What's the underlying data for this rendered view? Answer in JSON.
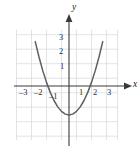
{
  "chart_data": {
    "type": "line",
    "title": "",
    "subtitle": "",
    "xlabel": "x",
    "ylabel": "y",
    "xlim": [
      -3.6,
      3.6
    ],
    "ylim": [
      -3.4,
      3.6
    ],
    "grid": true,
    "legend": false,
    "legend_position": "none",
    "x_ticks": [
      -3,
      -2,
      -1,
      1,
      2,
      3
    ],
    "x_tick_labels": [
      "–3",
      "–2",
      "–1",
      "1",
      "2",
      "3"
    ],
    "y_ticks": [
      1,
      2,
      3
    ],
    "y_tick_labels": [
      "1",
      "2",
      "3"
    ],
    "series": [
      {
        "name": "parabola",
        "equation": "y = x^2 - 2",
        "vertex": [
          0,
          -2
        ],
        "x_intercepts": [
          -1.41,
          1.41
        ],
        "y_intercept": -2,
        "opens": "up",
        "color": "#5f5f63",
        "x": [
          -2.25,
          -2.0,
          -1.75,
          -1.5,
          -1.25,
          -1.0,
          -0.75,
          -0.5,
          -0.25,
          0,
          0.25,
          0.5,
          0.75,
          1.0,
          1.25,
          1.5,
          1.75,
          2.0,
          2.25
        ],
        "values": [
          3.06,
          2.0,
          1.06,
          0.25,
          -0.44,
          -1.0,
          -1.44,
          -1.75,
          -1.94,
          -2.0,
          -1.94,
          -1.75,
          -1.44,
          -1.0,
          -0.44,
          0.25,
          1.06,
          2.0,
          3.06
        ]
      }
    ],
    "axis_label_x": "x",
    "axis_label_y": "y",
    "grid_color": "#d8d8dc",
    "axis_color": "#3a3a3a",
    "curve_color": "#5f5f63",
    "background": "#ffffff"
  },
  "labels": {
    "x_neg3": "–3",
    "x_neg2": "–2",
    "x_neg1": "–1",
    "x_pos1": "1",
    "x_pos2": "2",
    "x_pos3": "3",
    "y_pos1": "1",
    "y_pos2": "2",
    "y_pos3": "3",
    "axis_x": "x",
    "axis_y": "y"
  }
}
